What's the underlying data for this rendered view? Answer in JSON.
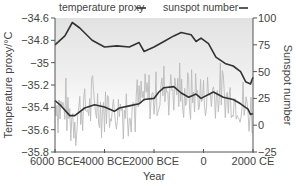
{
  "chart_data": {
    "type": "line",
    "title": "",
    "xlabel": "Year",
    "ylabel_left": "Temperature proxy/°C",
    "ylabel_right": "Sunspot number",
    "xlim": [
      -6000,
      2000
    ],
    "ylim_left": [
      -35.8,
      -34.6
    ],
    "ylim_right": [
      -25,
      100
    ],
    "grid": false,
    "legend_position": "top",
    "legend": [
      "temperature proxy",
      "sunspot number"
    ],
    "x_ticks": [
      {
        "value": -6000,
        "label": "6000 BCE"
      },
      {
        "value": -4000,
        "label": "4000 BCE"
      },
      {
        "value": -2000,
        "label": "2000 BCE"
      },
      {
        "value": 0,
        "label": "0"
      },
      {
        "value": 2000,
        "label": "2000 CE"
      }
    ],
    "y_left_ticks": [
      {
        "value": -34.6,
        "label": "−34.6"
      },
      {
        "value": -34.8,
        "label": "−34.8"
      },
      {
        "value": -35.0,
        "label": "−35"
      },
      {
        "value": -35.2,
        "label": "−35.2"
      },
      {
        "value": -35.4,
        "label": "−35.4"
      },
      {
        "value": -35.6,
        "label": "−35.6"
      },
      {
        "value": -35.8,
        "label": "−35.8"
      }
    ],
    "y_right_ticks": [
      {
        "value": 100,
        "label": "100"
      },
      {
        "value": 75,
        "label": "75"
      },
      {
        "value": 50,
        "label": "50"
      },
      {
        "value": 25,
        "label": "25"
      },
      {
        "value": 0,
        "label": "0"
      },
      {
        "value": -25,
        "label": "−25"
      }
    ],
    "series": [
      {
        "name": "temperature proxy",
        "axis": "left",
        "color": "#333333",
        "x": [
          -6000,
          -5600,
          -5300,
          -5000,
          -4500,
          -4000,
          -3500,
          -3000,
          -2600,
          -2400,
          -2000,
          -1600,
          -1200,
          -900,
          -500,
          -300,
          -100,
          200,
          500,
          900,
          1200,
          1500,
          1700,
          1900,
          2000
        ],
        "values": [
          -34.84,
          -34.76,
          -34.64,
          -34.69,
          -34.8,
          -34.86,
          -34.85,
          -34.86,
          -34.82,
          -34.9,
          -34.86,
          -34.81,
          -34.76,
          -34.73,
          -34.75,
          -34.81,
          -34.78,
          -34.83,
          -34.95,
          -35.01,
          -35.03,
          -35.08,
          -35.17,
          -35.19,
          -35.13
        ]
      },
      {
        "name": "sunspot number (smoothed)",
        "axis": "right",
        "color": "#333333",
        "x": [
          -6000,
          -5800,
          -5400,
          -5200,
          -4800,
          -4400,
          -4000,
          -3600,
          -3400,
          -3000,
          -2600,
          -2400,
          -2000,
          -1800,
          -1600,
          -1200,
          -900,
          -600,
          -300,
          -100,
          400,
          800,
          1200,
          1500,
          1800,
          1900,
          2000
        ],
        "values": [
          23,
          19,
          9,
          9,
          16,
          19,
          17,
          13,
          16,
          18,
          20,
          24,
          25,
          31,
          35,
          36,
          30,
          26,
          29,
          25,
          31,
          26,
          24,
          20,
          15,
          10,
          11
        ]
      },
      {
        "name": "sunspot number (raw, decadal)",
        "axis": "right",
        "color": "#bbbbbb",
        "note": "noisy gray series fluctuating roughly ±30 around the smoothed sunspot curve",
        "spread": 30
      }
    ]
  },
  "colors": {
    "line_dark": "#333333",
    "raw_gray": "#b8b8b8",
    "bg_top": "#e4e4e4",
    "bg_bottom": "#ffffff",
    "axis": "#555555"
  }
}
